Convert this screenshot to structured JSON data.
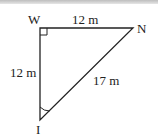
{
  "diagram": {
    "type": "right-triangle",
    "vertices": {
      "W": {
        "label": "W"
      },
      "N": {
        "label": "N"
      },
      "I": {
        "label": "I"
      }
    },
    "sides": {
      "WN": {
        "label": "12 m"
      },
      "WI": {
        "label": "12 m"
      },
      "NI": {
        "label": "17 m"
      }
    },
    "right_angle_at": "W",
    "marked_angle_at": "I",
    "colors": {
      "stroke": "#222222",
      "text": "#222222"
    }
  }
}
